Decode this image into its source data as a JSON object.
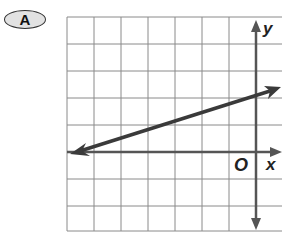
{
  "choice": {
    "label": "A"
  },
  "graph": {
    "x_axis_label": "x",
    "y_axis_label": "y",
    "origin_label": "O",
    "grid": {
      "x_min": -7,
      "x_max": 1,
      "y_min": -3,
      "y_max": 5,
      "cell_px": 27
    },
    "line": {
      "slope": "2/7",
      "y_intercept": 2,
      "points": [
        [
          -7,
          0
        ],
        [
          0,
          2
        ]
      ],
      "description": "line with arrows on both ends passing through (-7, 0) and (0, 2)"
    },
    "colors": {
      "grid": "#8a8a8a",
      "axis": "#555555",
      "line": "#3a3a3a"
    }
  }
}
